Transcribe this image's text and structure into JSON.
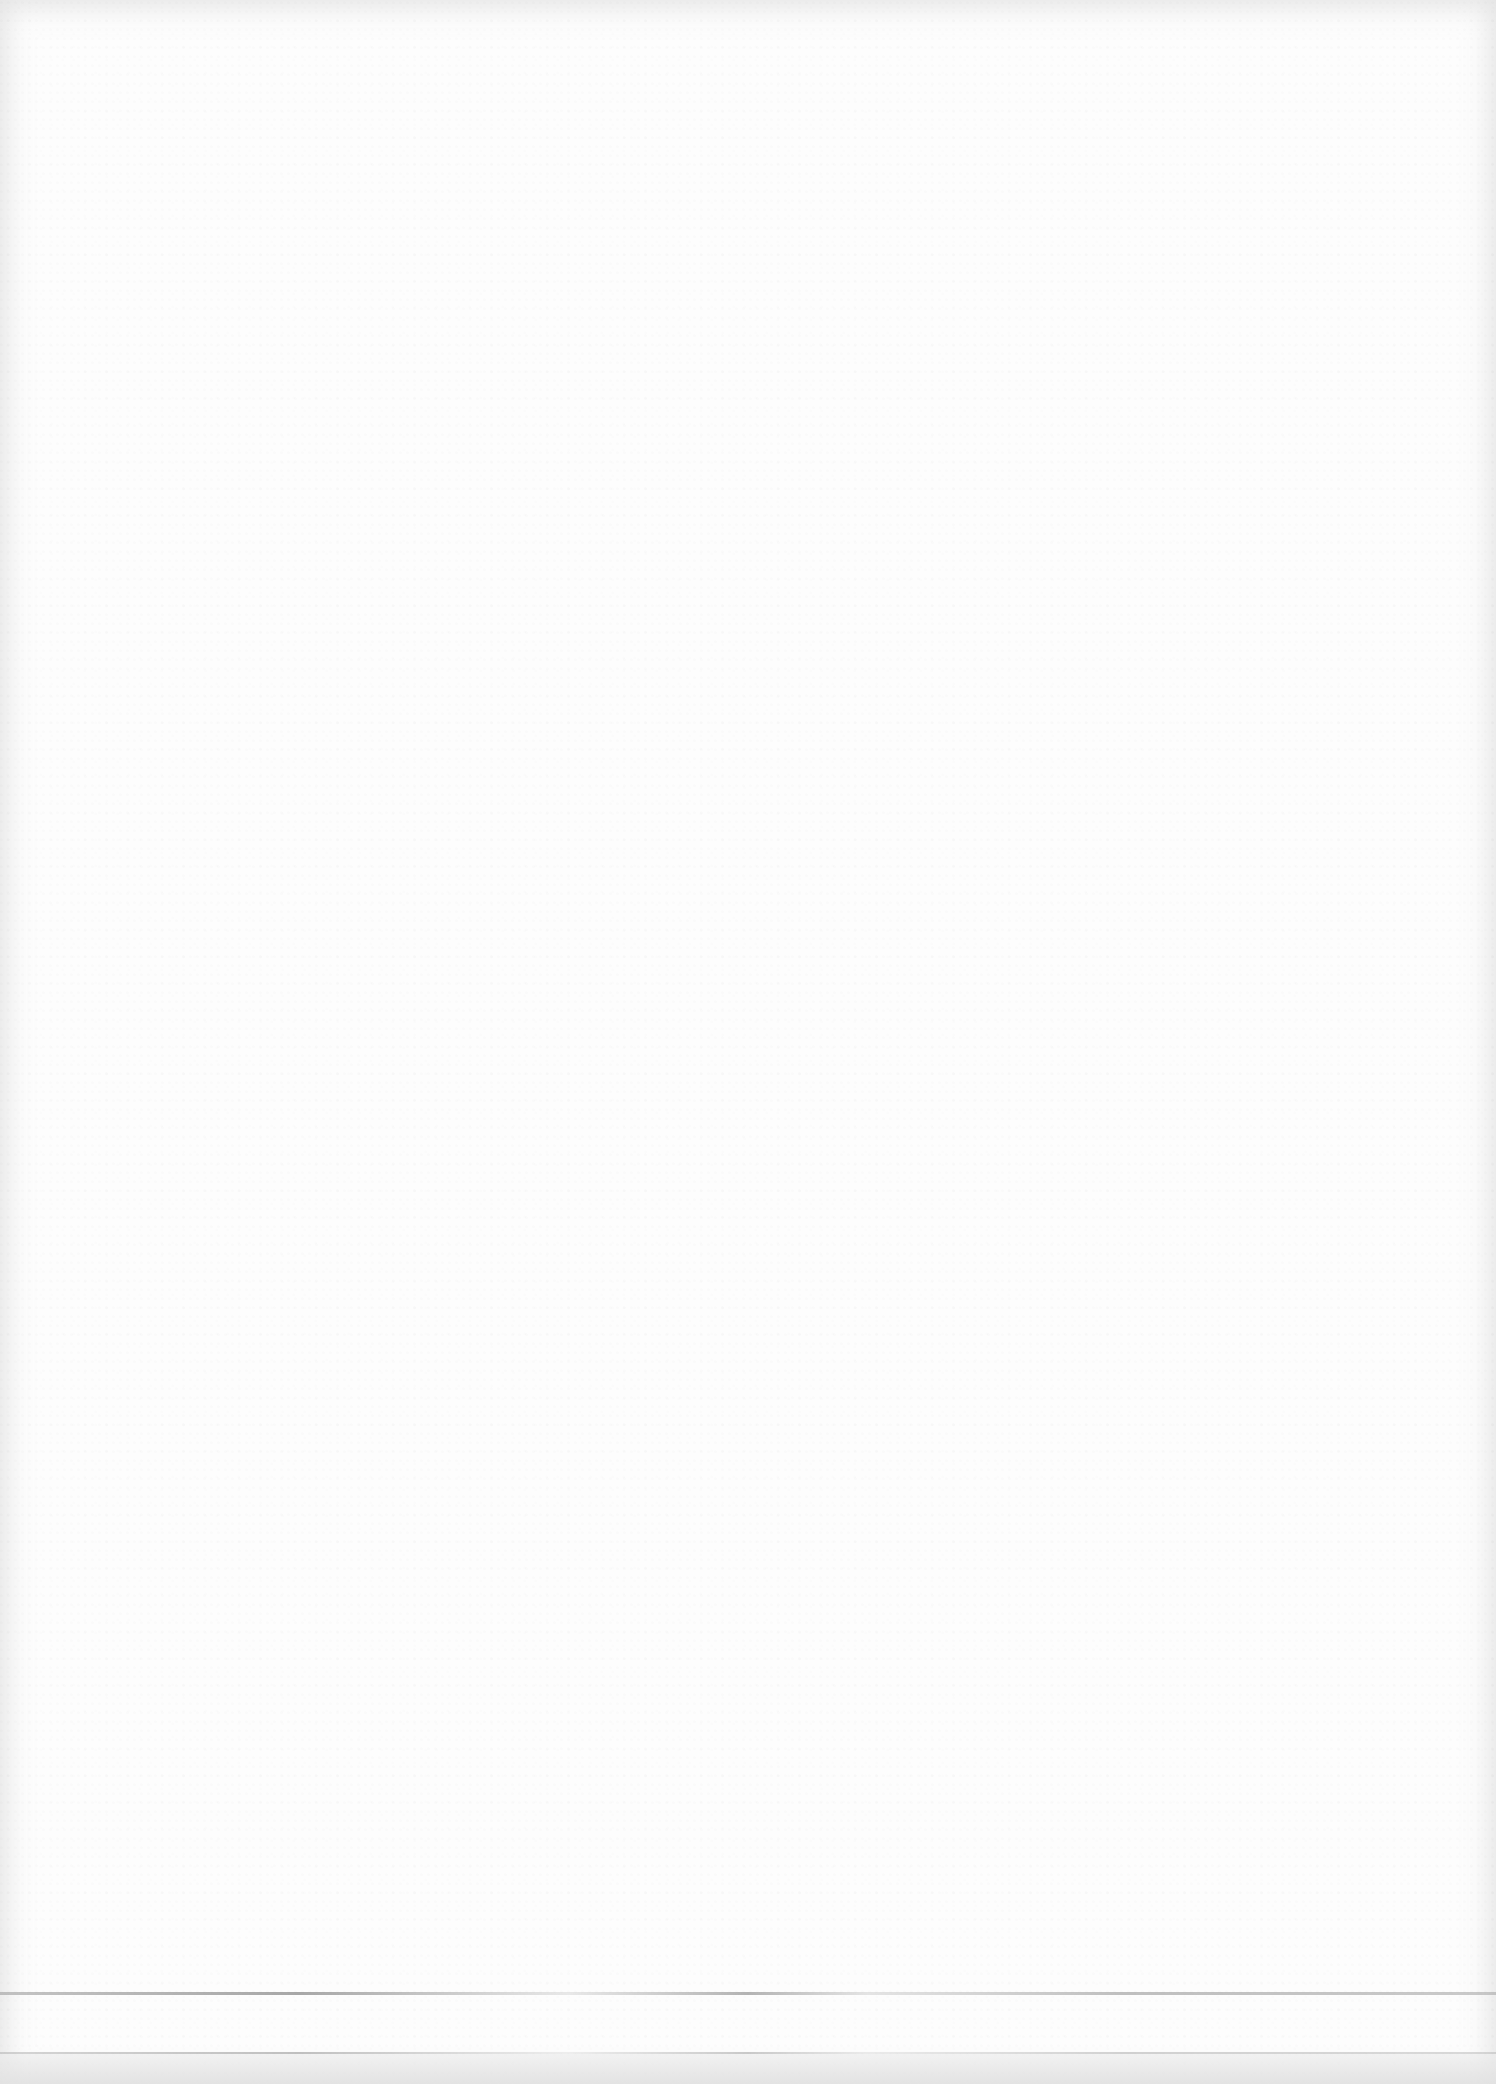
{
  "document": {
    "type": "blank scanned page",
    "body_text": "",
    "rules": [
      {
        "name": "upper-rule",
        "y": 1993
      },
      {
        "name": "lower-rule",
        "y": 2053
      }
    ]
  }
}
